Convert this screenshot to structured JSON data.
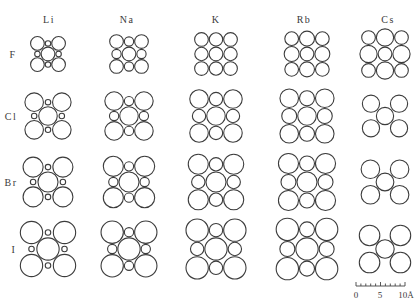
{
  "figure": {
    "px_per_angstrom": 5.4,
    "columns": [
      {
        "label": "Li",
        "x": 48,
        "label_x": 49
      },
      {
        "label": "Na",
        "x": 129,
        "label_x": 127
      },
      {
        "label": "K",
        "x": 216,
        "label_x": 216
      },
      {
        "label": "Rb",
        "x": 307,
        "label_x": 304
      },
      {
        "label": "Cs",
        "x": 385,
        "label_x": 388
      }
    ],
    "column_label_y": 23,
    "rows": [
      {
        "label": "F",
        "y": 54,
        "label_x": 13
      },
      {
        "label": "Cl",
        "y": 116,
        "label_x": 11
      },
      {
        "label": "Br",
        "y": 182,
        "label_x": 11
      },
      {
        "label": "I",
        "y": 249,
        "label_x": 14
      }
    ],
    "cation_radii_angstrom": {
      "Li": 0.6,
      "Na": 0.95,
      "K": 1.33,
      "Rb": 1.48,
      "Cs": 1.69
    },
    "anion_radii_angstrom": {
      "F": 1.36,
      "Cl": 1.81,
      "Br": 1.95,
      "I": 2.16
    },
    "cells": [
      {
        "cation": "Li",
        "anion": "F",
        "structure": "rocksalt"
      },
      {
        "cation": "Na",
        "anion": "F",
        "structure": "rocksalt"
      },
      {
        "cation": "K",
        "anion": "F",
        "structure": "rocksalt"
      },
      {
        "cation": "Rb",
        "anion": "F",
        "structure": "rocksalt"
      },
      {
        "cation": "Cs",
        "anion": "F",
        "structure": "rocksalt"
      },
      {
        "cation": "Li",
        "anion": "Cl",
        "structure": "rocksalt"
      },
      {
        "cation": "Na",
        "anion": "Cl",
        "structure": "rocksalt"
      },
      {
        "cation": "K",
        "anion": "Cl",
        "structure": "rocksalt"
      },
      {
        "cation": "Rb",
        "anion": "Cl",
        "structure": "rocksalt"
      },
      {
        "cation": "Cs",
        "anion": "Cl",
        "structure": "cesium-chloride"
      },
      {
        "cation": "Li",
        "anion": "Br",
        "structure": "rocksalt"
      },
      {
        "cation": "Na",
        "anion": "Br",
        "structure": "rocksalt"
      },
      {
        "cation": "K",
        "anion": "Br",
        "structure": "rocksalt"
      },
      {
        "cation": "Rb",
        "anion": "Br",
        "structure": "rocksalt"
      },
      {
        "cation": "Cs",
        "anion": "Br",
        "structure": "cesium-chloride"
      },
      {
        "cation": "Li",
        "anion": "I",
        "structure": "rocksalt"
      },
      {
        "cation": "Na",
        "anion": "I",
        "structure": "rocksalt"
      },
      {
        "cation": "K",
        "anion": "I",
        "structure": "rocksalt"
      },
      {
        "cation": "Rb",
        "anion": "I",
        "structure": "rocksalt"
      },
      {
        "cation": "Cs",
        "anion": "I",
        "structure": "cesium-chloride"
      }
    ],
    "scale_bar": {
      "x0": 356,
      "x1": 405,
      "y": 286,
      "ticks": 10,
      "labels": [
        {
          "text": "0",
          "x": 356
        },
        {
          "text": "5",
          "x": 380
        },
        {
          "text": "10Å",
          "x": 406
        }
      ],
      "label_y": 298
    },
    "stroke_color": "#3c3c3c",
    "text_color": "#3a3a3a"
  }
}
